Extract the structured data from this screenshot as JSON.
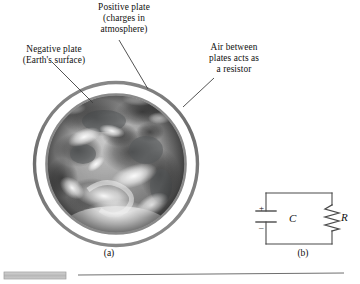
{
  "figure": {
    "callouts": [
      {
        "id": "negative",
        "text": "Negative plate\n(Earth's surface)"
      },
      {
        "id": "positive",
        "text": "Positive plate\n(charges in\natmosphere)"
      },
      {
        "id": "air",
        "text": "Air between\nplates acts as\na resistor"
      }
    ],
    "panel_labels": {
      "a": "(a)",
      "b": "(b)"
    },
    "earth": {
      "alt_name": "earth-globe-photograph",
      "outer_ring_color": "#7c7c7c",
      "inner_ring_color": "#8a8a8a",
      "gap_color": "#ffffff"
    },
    "circuit": {
      "capacitor_label": "C",
      "resistor_label": "R",
      "plus_sign": "+",
      "minus_sign": "–",
      "wire_color": "#4a4a4a"
    },
    "rule": {
      "line_color": "#6f6f6f",
      "swatch_color": "#bdbdbd"
    }
  }
}
